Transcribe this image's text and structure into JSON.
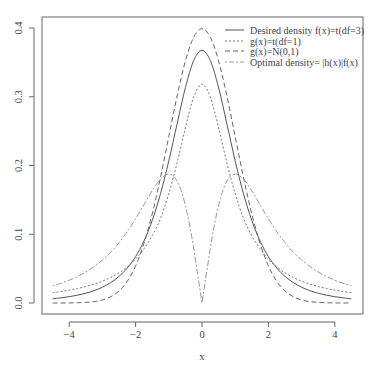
{
  "chart_data": {
    "type": "line",
    "title": "",
    "xlabel": "x",
    "ylabel": "",
    "xlim": [
      -4.5,
      4.5
    ],
    "ylim": [
      0,
      0.4
    ],
    "x_ticks": [
      -4,
      -2,
      0,
      2,
      4
    ],
    "x_tick_labels": [
      "−4",
      "−2",
      "0",
      "2",
      "4"
    ],
    "y_ticks": [
      0.0,
      0.1,
      0.2,
      0.3,
      0.4
    ],
    "y_tick_labels": [
      "0.0",
      "0.1",
      "0.2",
      "0.3",
      "0.4"
    ],
    "grid": false,
    "legend_position": "top-right",
    "x": [
      0,
      0.25,
      0.5,
      0.75,
      1.0,
      1.25,
      1.5,
      1.75,
      2.0,
      2.25,
      2.5,
      2.75,
      3.0,
      3.25,
      3.5,
      3.75,
      4.0,
      4.25,
      4.5
    ],
    "symmetric_about_zero": true,
    "series": [
      {
        "name": "Desired density f(x)=t(df=3)",
        "line_style": "solid",
        "color": "#555555",
        "values": [
          0.3676,
          0.3527,
          0.3132,
          0.2606,
          0.2067,
          0.1589,
          0.12,
          0.09,
          0.0675,
          0.0509,
          0.0387,
          0.0297,
          0.023,
          0.018,
          0.0142,
          0.0114,
          0.0092,
          0.0075,
          0.0061
        ]
      },
      {
        "name": "g(x)=t(df=1)",
        "line_style": "dotted",
        "color": "#777777",
        "values": [
          0.3183,
          0.2996,
          0.2546,
          0.2037,
          0.1592,
          0.1232,
          0.0979,
          0.0788,
          0.0637,
          0.0526,
          0.0439,
          0.0372,
          0.0318,
          0.0275,
          0.024,
          0.0211,
          0.0187,
          0.0167,
          0.015
        ]
      },
      {
        "name": "g(x)=N(0,1)",
        "line_style": "dashed",
        "color": "#666666",
        "values": [
          0.3989,
          0.3867,
          0.3521,
          0.3011,
          0.242,
          0.1826,
          0.1295,
          0.0863,
          0.054,
          0.0317,
          0.0175,
          0.0091,
          0.0044,
          0.002,
          0.0009,
          0.0004,
          0.0001,
          0.0,
          0.0
        ]
      },
      {
        "name": "Optimal density= |h(x)|f(x)",
        "line_style": "dotdash",
        "color": "#999999",
        "values": [
          0.0,
          0.08,
          0.142,
          0.1773,
          0.1875,
          0.1801,
          0.1633,
          0.1428,
          0.1224,
          0.1038,
          0.0877,
          0.0739,
          0.0625,
          0.053,
          0.0451,
          0.0386,
          0.0332,
          0.0287,
          0.025
        ]
      }
    ]
  },
  "legend": {
    "items": [
      "Desired density f(x)=t(df=3)",
      "g(x)=t(df=1)",
      "g(x)=N(0,1)",
      "Optimal density= |h(x)|f(x)"
    ]
  }
}
